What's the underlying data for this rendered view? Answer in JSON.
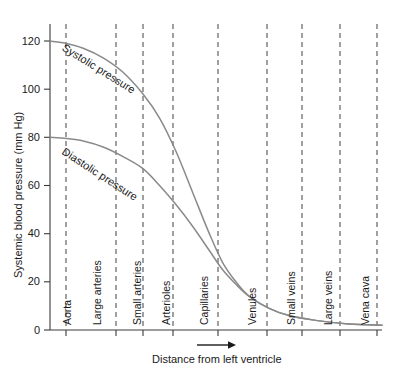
{
  "figure": {
    "background_color": "#ffffff",
    "axis_color": "#3a3a3a",
    "grid_color": "#4a4a4a",
    "curve_color": "#8a8a8a",
    "text_color": "#1a1a1a"
  },
  "chart_data": {
    "type": "line",
    "title": "",
    "xlabel": "Distance from left ventricle",
    "ylabel": "Systemic blood pressure (mm Hg)",
    "ylim": [
      0,
      128
    ],
    "yticks": [
      0,
      20,
      40,
      60,
      80,
      100,
      120
    ],
    "ytick_labels": [
      "0",
      "20",
      "40",
      "60",
      "80",
      "100",
      "120"
    ],
    "xlim": [
      0,
      10
    ],
    "grid": "vertical dashed segment boundaries",
    "legend": "inline curve labels",
    "categories": [
      "Aorta",
      "Large arteries",
      "Small arteries",
      "Arterioles",
      "Capillaries",
      "Venules",
      "Small veins",
      "Large veins",
      "Vena cava"
    ],
    "category_boundaries_px": [
      50,
      66,
      116,
      143,
      173,
      218,
      267,
      302,
      340,
      377
    ],
    "series": [
      {
        "name": "Systolic pressure",
        "label": "Systolic pressure",
        "x": [
          0.0,
          0.5,
          1.0,
          1.6,
          2.2,
          2.8,
          3.3,
          3.8,
          4.3,
          4.8,
          5.2,
          5.6,
          6.0,
          6.6,
          7.2,
          8.0,
          9.0,
          10.0
        ],
        "values": [
          120,
          119,
          117,
          113,
          107,
          98,
          88,
          74,
          57,
          40,
          28,
          20,
          14,
          9,
          6,
          4,
          2.5,
          2
        ]
      },
      {
        "name": "Diastolic pressure",
        "label": "Diastolic pressure",
        "x": [
          0.0,
          0.5,
          1.0,
          1.6,
          2.2,
          2.8,
          3.3,
          3.8,
          4.3,
          4.8,
          5.2,
          5.6,
          6.0,
          6.6,
          7.2,
          8.0,
          9.0,
          10.0
        ],
        "values": [
          80,
          79.5,
          78.5,
          76,
          72,
          67,
          60,
          52,
          43,
          33,
          25,
          19,
          14,
          9,
          6,
          4,
          2.5,
          2
        ]
      }
    ],
    "arrow_annotation": {
      "label": "direction-of-flow-arrow",
      "direction": "right"
    }
  }
}
